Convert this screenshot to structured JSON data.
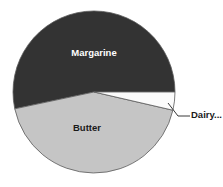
{
  "chart_data": {
    "type": "pie",
    "title": "",
    "subtitle": "",
    "xlabel": "",
    "ylabel": "",
    "legend_position": "none",
    "grid": false,
    "categories": [
      "Margarine",
      "Butter",
      "Dairy..."
    ],
    "values": [
      53,
      43,
      4
    ],
    "units": "percent",
    "slices": [
      {
        "label": "Margarine",
        "value": 53,
        "color": "#333333",
        "label_color": "#ffffff",
        "label_placement": "inside",
        "start_angle_deg": 0,
        "end_angle_deg": 192
      },
      {
        "label": "Butter",
        "value": 43,
        "color": "#c5c5c5",
        "label_color": "#1a1a1a",
        "label_placement": "inside",
        "start_angle_deg": 192,
        "end_angle_deg": 347
      },
      {
        "label": "Dairy...",
        "value": 4,
        "color": "#fbfbfb",
        "label_color": "#1a1a1a",
        "label_placement": "callout",
        "start_angle_deg": 347,
        "end_angle_deg": 360
      }
    ]
  },
  "figure": {
    "background": "#ffffff",
    "slice_outline_color": "#5a5a5a",
    "center_x": 94,
    "center_y": 92,
    "radius": 81
  },
  "labels": {
    "margarine": "Margarine",
    "butter": "Butter",
    "dairy": "Dairy..."
  }
}
